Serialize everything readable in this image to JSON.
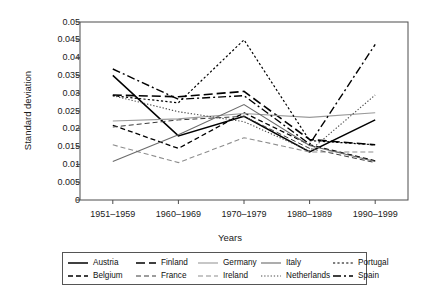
{
  "chart_data": {
    "type": "line",
    "title": "",
    "xlabel": "Years",
    "ylabel": "Standard deviation",
    "categories": [
      "1951–1959",
      "1960–1969",
      "1970–1979",
      "1980–1989",
      "1990–1999"
    ],
    "ylim": [
      0,
      0.05
    ],
    "yticks": [
      0,
      0.005,
      0.01,
      0.015,
      0.02,
      0.025,
      0.03,
      0.035,
      0.04,
      0.045,
      0.05
    ],
    "ytick_labels": [
      "0",
      "0.005",
      "0.01",
      "0.015",
      "0.02",
      "0.025",
      "0.03",
      "0.035",
      "0.04",
      "0.045",
      "0.05"
    ],
    "grid": false,
    "legend_position": "bottom",
    "legend_columns": 5,
    "legend_rows": 2,
    "series": [
      {
        "name": "Austria",
        "values": [
          0.035,
          0.018,
          0.0235,
          0.0135,
          0.0225
        ],
        "style": "solid",
        "color": "#000000",
        "width": 1.5
      },
      {
        "name": "Belgium",
        "values": [
          0.021,
          0.0145,
          0.0245,
          0.0155,
          0.011
        ],
        "style": "dashed",
        "color": "#000000",
        "width": 1.3
      },
      {
        "name": "Finland",
        "values": [
          0.0295,
          0.029,
          0.0305,
          0.017,
          0.0155
        ],
        "style": "long-dash",
        "color": "#000000",
        "width": 1.6
      },
      {
        "name": "France",
        "values": [
          0.0205,
          0.0225,
          0.0235,
          0.0145,
          0.0105
        ],
        "style": "dashed",
        "color": "#3a3a3a",
        "width": 1.0
      },
      {
        "name": "Germany",
        "values": [
          0.0222,
          0.0228,
          0.0243,
          0.0232,
          0.0245
        ],
        "style": "solid",
        "color": "#9a9a9a",
        "width": 1.1
      },
      {
        "name": "Ireland",
        "values": [
          0.0155,
          0.0105,
          0.0175,
          0.0135,
          0.0135
        ],
        "style": "dashed",
        "color": "#8d8d8d",
        "width": 1.1
      },
      {
        "name": "Italy",
        "values": [
          0.0108,
          0.0183,
          0.0268,
          0.0153,
          0.0108
        ],
        "style": "solid",
        "color": "#6b6b6b",
        "width": 1.1
      },
      {
        "name": "Netherlands",
        "values": [
          0.0293,
          0.0248,
          0.022,
          0.0138,
          0.0295
        ],
        "style": "fine-dotted",
        "color": "#4a4a4a",
        "width": 1.1
      },
      {
        "name": "Portugal",
        "values": [
          0.0293,
          0.0273,
          0.045,
          0.0167,
          0.0155
        ],
        "style": "dotted",
        "color": "#000000",
        "width": 1.2
      },
      {
        "name": "Spain",
        "values": [
          0.0368,
          0.0283,
          0.0293,
          0.0157,
          0.0437
        ],
        "style": "dash-dot",
        "color": "#000000",
        "width": 1.4
      }
    ]
  },
  "legend": {
    "entries": [
      {
        "label": "Austria"
      },
      {
        "label": "Belgium"
      },
      {
        "label": "Finland"
      },
      {
        "label": "France"
      },
      {
        "label": "Germany"
      },
      {
        "label": "Ireland"
      },
      {
        "label": "Italy"
      },
      {
        "label": "Netherlands"
      },
      {
        "label": "Portugal"
      },
      {
        "label": "Spain"
      }
    ]
  }
}
